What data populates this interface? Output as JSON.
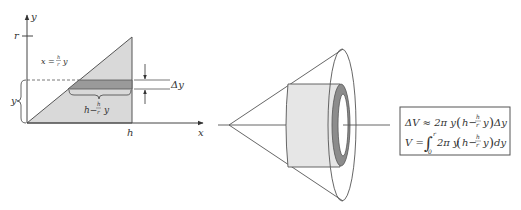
{
  "left_figure": {
    "axis_y_label": "y",
    "axis_x_label": "x",
    "tick_r_label": "r",
    "tick_h_label": "h",
    "curve_label_lhs": "x = ",
    "curve_frac_num": "h",
    "curve_frac_den": "r",
    "curve_label_var": "y",
    "strip_thickness_label": "Δy",
    "y_brace_label": "y",
    "strip_length_prefix": "h−",
    "strip_length_num": "h",
    "strip_length_den": "r",
    "strip_length_var": "y"
  },
  "formulas": {
    "line1_lhs": "ΔV ≈ 2π y",
    "line1_num": "h",
    "line1_den": "r",
    "line1_h": "h−",
    "line1_y": "y",
    "line1_tail": "Δy",
    "line2_lhs": "V =",
    "line2_int_upper": "r",
    "line2_int_lower": "0",
    "line2_body": "2π y",
    "line2_h": "h−",
    "line2_num": "h",
    "line2_den": "r",
    "line2_y": "y",
    "line2_tail": "dy"
  },
  "colors": {
    "region_fill": "#d9d9d9",
    "strip_fill": "#9a9a9a",
    "cylinder_fill": "#e6e6e6",
    "ring_fill": "#8c8c8c",
    "line": "#555555"
  }
}
